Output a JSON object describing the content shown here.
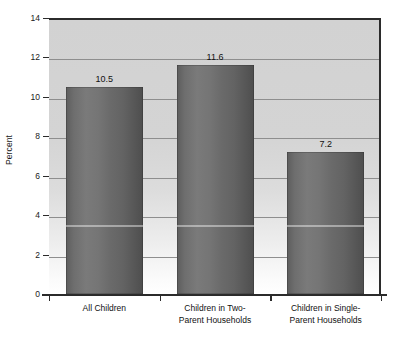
{
  "chart_data": {
    "type": "bar",
    "title": "",
    "subtitle": "",
    "xlabel": "",
    "ylabel": "Percent",
    "categories": [
      "All Children",
      "Children in Two-Parent Households",
      "Children in Single-Parent Households"
    ],
    "category_lines": [
      [
        "All Children"
      ],
      [
        "Children in Two-",
        "Parent Households"
      ],
      [
        "Children in Single-",
        "Parent Households"
      ]
    ],
    "values": [
      10.5,
      11.6,
      7.2
    ],
    "value_labels": [
      "10.5",
      "11.6",
      "7.2"
    ],
    "ylim": [
      0,
      14
    ],
    "ytick_values": [
      0,
      2,
      4,
      6,
      8,
      10,
      12,
      14
    ],
    "ytick_labels": [
      "0",
      "2",
      "4",
      "6",
      "8",
      "10",
      "12",
      "14"
    ],
    "grid": "horizontal",
    "legend": "none",
    "colors": {
      "bar_fill": "#6b6b6b",
      "bar_fill_light": "#7a7a7a",
      "bar_fill_dark": "#4e4e4e",
      "plot_background_top": "#d2d2d2",
      "plot_background_bottom": "#ffffff",
      "gridline": "#8e8e8e",
      "axis": "#2b2b2b",
      "text": "#111111",
      "page_background": "#ffffff"
    }
  }
}
